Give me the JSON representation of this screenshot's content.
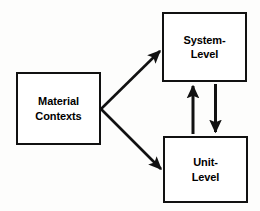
{
  "diagram": {
    "background_color": "#fdfdfc",
    "line_color": "#111111",
    "box_fill_color": "#ffffff",
    "nodes": [
      {
        "id": "material",
        "label": "Material\nContexts",
        "line1": "Material",
        "line2": "Contexts",
        "x": 16,
        "y": 72,
        "width": 85,
        "height": 73
      },
      {
        "id": "system",
        "label": "System-\nLevel",
        "line1": "System-",
        "line2": "Level",
        "x": 162,
        "y": 12,
        "width": 85,
        "height": 70
      },
      {
        "id": "unit",
        "label": "Unit-\nLevel",
        "line1": "Unit-",
        "line2": "Level",
        "x": 163,
        "y": 136,
        "width": 85,
        "height": 67
      }
    ],
    "edges": [
      {
        "id": "material-to-system",
        "from": "material",
        "to": "system",
        "direction": "one-way",
        "style": "diagonal-up-right"
      },
      {
        "id": "material-to-unit",
        "from": "material",
        "to": "unit",
        "direction": "one-way",
        "style": "diagonal-down-right"
      },
      {
        "id": "unit-to-system",
        "from": "unit",
        "to": "system",
        "direction": "one-way",
        "style": "vertical-up"
      },
      {
        "id": "system-to-unit",
        "from": "system",
        "to": "unit",
        "direction": "one-way",
        "style": "vertical-down"
      }
    ]
  }
}
